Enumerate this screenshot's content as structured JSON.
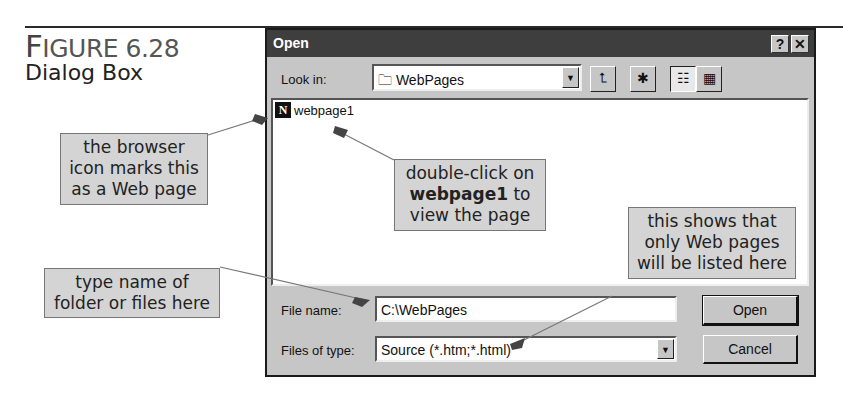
{
  "figure": {
    "label_cap": "F",
    "label_rest": "IGURE 6.28",
    "subtitle": "Dialog Box"
  },
  "dialog": {
    "title": "Open",
    "help_button": "?",
    "close_button": "✕",
    "look_in_label": "Look in:",
    "look_in_value": "WebPages",
    "toolbar": {
      "up_folder_icon": "⮤",
      "new_folder_icon": "✱",
      "list_view_icon": "☷",
      "details_view_icon": "▦"
    },
    "files": [
      {
        "name": "webpage1",
        "icon": "N"
      }
    ],
    "file_name_label": "File name:",
    "file_name_value": "C:\\WebPages",
    "files_of_type_label": "Files of type:",
    "files_of_type_value": "Source (*.htm;*.html)",
    "open_button": "Open",
    "cancel_button": "Cancel",
    "dropdown_arrow": "▼"
  },
  "callouts": {
    "browser_icon": [
      "the browser",
      "icon marks this",
      "as a Web page"
    ],
    "double_click": {
      "line1": "double-click on",
      "bold": "webpage1",
      "after_bold": " to",
      "line3": "view the page"
    },
    "type_name": [
      "type name of",
      "folder or files here"
    ],
    "files_type": [
      "this shows that",
      "only Web pages",
      "will be listed here"
    ]
  },
  "colors": {
    "dialog_bg": "#c6c6c6",
    "titlebar": "#3e3e3e",
    "callout_bg": "#d4d4d4"
  }
}
